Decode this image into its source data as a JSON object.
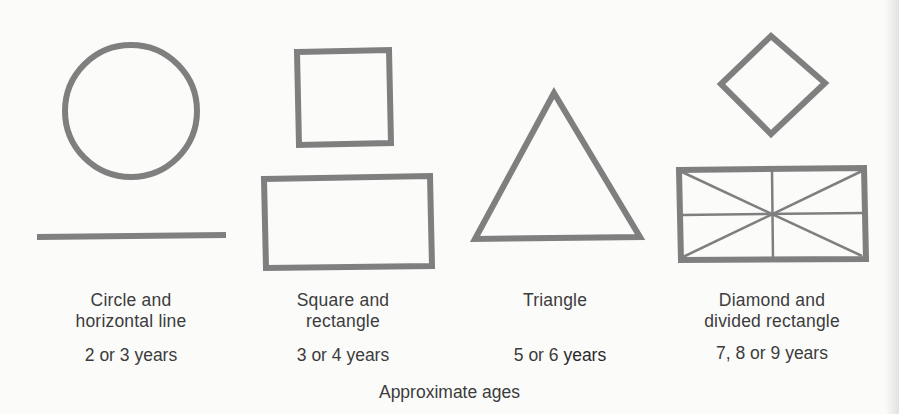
{
  "figure": {
    "stroke_color": "#7f7f7f",
    "background_color": "#fbfbfa",
    "caption": "Approximate ages",
    "groups": [
      {
        "id": "circle-line",
        "shapes": [
          "circle",
          "horizontal-line"
        ],
        "label_lines": [
          "Circle and",
          "horizontal line"
        ],
        "age": "2 or 3 years"
      },
      {
        "id": "square-rectangle",
        "shapes": [
          "square",
          "rectangle"
        ],
        "label_lines": [
          "Square and",
          "rectangle"
        ],
        "age": "3 or 4 years"
      },
      {
        "id": "triangle",
        "shapes": [
          "triangle"
        ],
        "label_lines": [
          "Triangle"
        ],
        "age_prefix": "5 or 6",
        "age_suffix": "years",
        "age": "5 or 6 years"
      },
      {
        "id": "diamond-divided-rectangle",
        "shapes": [
          "diamond",
          "divided-rectangle"
        ],
        "label_lines": [
          "Diamond and",
          "divided rectangle"
        ],
        "age": "7, 8 or 9 years"
      }
    ]
  }
}
